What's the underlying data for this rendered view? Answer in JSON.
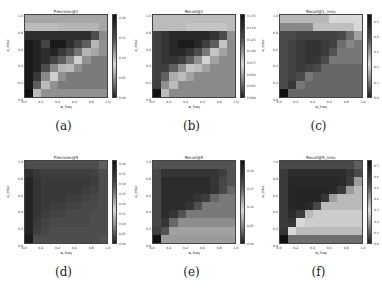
{
  "figure": {
    "panels": [
      {
        "caption": "(a)",
        "title": "Precision@1",
        "xlabel": "w_freq",
        "ylabel": "w_misc",
        "cbar_ticks": [
          "0.00",
          "0.05",
          "0.10",
          "0.15",
          "0.20"
        ],
        "cbar_max": 0.21
      },
      {
        "caption": "(b)",
        "title": "Recall@1",
        "xlabel": "w_freq",
        "ylabel": "w_misc",
        "cbar_ticks": [
          "0.000",
          "0.025",
          "0.050",
          "0.075",
          "0.100",
          "0.125",
          "0.150",
          "0.175"
        ],
        "cbar_max": 0.18
      },
      {
        "caption": "(c)",
        "title": "Recall@1_misc",
        "xlabel": "w_freq",
        "ylabel": "w_misc",
        "cbar_ticks": [
          "0.0",
          "0.1",
          "0.2",
          "0.3",
          "0.4",
          "0.5"
        ],
        "cbar_max": 0.55
      },
      {
        "caption": "(d)",
        "title": "Precision@5",
        "xlabel": "w_freq",
        "ylabel": "w_misc",
        "cbar_ticks": [
          "0.00",
          "0.05",
          "0.10",
          "0.15",
          "0.20",
          "0.25",
          "0.30",
          "0.35",
          "0.40"
        ],
        "cbar_max": 0.42
      },
      {
        "caption": "(e)",
        "title": "Recall@5",
        "xlabel": "w_freq",
        "ylabel": "w_misc",
        "cbar_ticks": [
          "0.00",
          "0.05",
          "0.10",
          "0.15",
          "0.20"
        ],
        "cbar_max": 0.23
      },
      {
        "caption": "(f)",
        "title": "Recall@5_misc",
        "xlabel": "w_freq",
        "ylabel": "w_misc",
        "cbar_ticks": [
          "0.0",
          "0.1",
          "0.2",
          "0.3",
          "0.4",
          "0.5",
          "0.6",
          "0.7"
        ],
        "cbar_max": 0.75
      }
    ],
    "xticks": [
      "0.0",
      "0.2",
      "0.4",
      "0.6",
      "0.8",
      "1.0"
    ],
    "yticks": [
      "0.0",
      "0.2",
      "0.4",
      "0.6",
      "0.8",
      "1.0"
    ]
  },
  "chart_data": [
    {
      "type": "heatmap",
      "title": "Precision@1",
      "xlabel": "w_freq",
      "ylabel": "w_misc",
      "x": [
        0.0,
        0.1,
        0.2,
        0.3,
        0.4,
        0.5,
        0.6,
        0.7,
        0.8,
        0.9
      ],
      "y": [
        0.9,
        0.8,
        0.7,
        0.6,
        0.5,
        0.4,
        0.3,
        0.2,
        0.1,
        0.0
      ],
      "zlim": [
        0,
        0.21
      ],
      "z": [
        [
          0.06,
          0.06,
          0.06,
          0.06,
          0.06,
          0.06,
          0.06,
          0.06,
          0.06,
          0.06
        ],
        [
          0.07,
          0.07,
          0.07,
          0.07,
          0.1,
          0.1,
          0.1,
          0.1,
          0.1,
          0.06
        ],
        [
          0.18,
          0.18,
          0.18,
          0.18,
          0.18,
          0.18,
          0.18,
          0.18,
          0.15,
          0.12
        ],
        [
          0.2,
          0.19,
          0.16,
          0.2,
          0.2,
          0.18,
          0.16,
          0.14,
          0.1,
          0.05
        ],
        [
          0.2,
          0.19,
          0.18,
          0.19,
          0.17,
          0.15,
          0.13,
          0.1,
          0.06,
          0.05
        ],
        [
          0.2,
          0.19,
          0.18,
          0.16,
          0.14,
          0.12,
          0.08,
          0.05,
          0.04,
          0.04
        ],
        [
          0.2,
          0.19,
          0.15,
          0.12,
          0.1,
          0.07,
          0.05,
          0.04,
          0.04,
          0.04
        ],
        [
          0.2,
          0.17,
          0.12,
          0.08,
          0.05,
          0.04,
          0.04,
          0.04,
          0.04,
          0.04
        ],
        [
          0.2,
          0.14,
          0.07,
          0.05,
          0.04,
          0.04,
          0.04,
          0.04,
          0.04,
          0.04
        ],
        [
          0.21,
          0.07,
          0.05,
          0.05,
          0.05,
          0.05,
          0.05,
          0.05,
          0.05,
          0.05
        ]
      ]
    },
    {
      "type": "heatmap",
      "title": "Recall@1",
      "xlabel": "w_freq",
      "ylabel": "w_misc",
      "x": [
        0.0,
        0.1,
        0.2,
        0.3,
        0.4,
        0.5,
        0.6,
        0.7,
        0.8,
        0.9
      ],
      "y": [
        0.9,
        0.8,
        0.7,
        0.6,
        0.5,
        0.4,
        0.3,
        0.2,
        0.1,
        0.0
      ],
      "zlim": [
        0,
        0.18
      ],
      "z": [
        [
          0.06,
          0.06,
          0.06,
          0.06,
          0.06,
          0.06,
          0.06,
          0.06,
          0.06,
          0.06
        ],
        [
          0.06,
          0.06,
          0.06,
          0.06,
          0.08,
          0.08,
          0.08,
          0.08,
          0.08,
          0.06
        ],
        [
          0.14,
          0.15,
          0.16,
          0.16,
          0.16,
          0.16,
          0.16,
          0.15,
          0.13,
          0.1
        ],
        [
          0.14,
          0.15,
          0.16,
          0.17,
          0.17,
          0.16,
          0.14,
          0.12,
          0.08,
          0.04
        ],
        [
          0.14,
          0.15,
          0.16,
          0.16,
          0.15,
          0.13,
          0.11,
          0.08,
          0.05,
          0.04
        ],
        [
          0.14,
          0.15,
          0.15,
          0.14,
          0.12,
          0.1,
          0.07,
          0.05,
          0.04,
          0.04
        ],
        [
          0.14,
          0.14,
          0.12,
          0.1,
          0.08,
          0.06,
          0.05,
          0.04,
          0.04,
          0.04
        ],
        [
          0.14,
          0.12,
          0.09,
          0.06,
          0.05,
          0.04,
          0.04,
          0.04,
          0.04,
          0.04
        ],
        [
          0.14,
          0.1,
          0.06,
          0.04,
          0.04,
          0.04,
          0.04,
          0.04,
          0.04,
          0.04
        ],
        [
          0.18,
          0.06,
          0.04,
          0.04,
          0.04,
          0.04,
          0.04,
          0.04,
          0.04,
          0.04
        ]
      ]
    },
    {
      "type": "heatmap",
      "title": "Recall@1_misc",
      "xlabel": "w_freq",
      "ylabel": "w_misc",
      "x": [
        0.0,
        0.1,
        0.2,
        0.3,
        0.4,
        0.5,
        0.6,
        0.7,
        0.8,
        0.9
      ],
      "y": [
        0.9,
        0.8,
        0.7,
        0.6,
        0.5,
        0.4,
        0.3,
        0.2,
        0.1,
        0.0
      ],
      "zlim": [
        0,
        0.55
      ],
      "z": [
        [
          0.18,
          0.18,
          0.18,
          0.18,
          0.18,
          0.18,
          0.22,
          0.22,
          0.22,
          0.22
        ],
        [
          0.12,
          0.12,
          0.12,
          0.12,
          0.25,
          0.25,
          0.25,
          0.25,
          0.25,
          0.22
        ],
        [
          0.4,
          0.4,
          0.42,
          0.42,
          0.42,
          0.42,
          0.42,
          0.4,
          0.35,
          0.15
        ],
        [
          0.4,
          0.42,
          0.44,
          0.46,
          0.46,
          0.44,
          0.42,
          0.35,
          0.12,
          0.1
        ],
        [
          0.4,
          0.42,
          0.44,
          0.46,
          0.46,
          0.44,
          0.38,
          0.1,
          0.1,
          0.1
        ],
        [
          0.4,
          0.42,
          0.44,
          0.46,
          0.45,
          0.4,
          0.1,
          0.1,
          0.1,
          0.1
        ],
        [
          0.4,
          0.42,
          0.44,
          0.42,
          0.4,
          0.08,
          0.08,
          0.08,
          0.08,
          0.08
        ],
        [
          0.4,
          0.42,
          0.4,
          0.1,
          0.08,
          0.08,
          0.08,
          0.08,
          0.08,
          0.08
        ],
        [
          0.4,
          0.45,
          0.1,
          0.08,
          0.08,
          0.08,
          0.08,
          0.08,
          0.08,
          0.08
        ],
        [
          0.55,
          0.08,
          0.08,
          0.08,
          0.08,
          0.08,
          0.08,
          0.08,
          0.08,
          0.08
        ]
      ]
    },
    {
      "type": "heatmap",
      "title": "Precision@5",
      "xlabel": "w_freq",
      "ylabel": "w_misc",
      "x": [
        0.0,
        0.1,
        0.2,
        0.3,
        0.4,
        0.5,
        0.6,
        0.7,
        0.8,
        0.9
      ],
      "y": [
        0.9,
        0.8,
        0.7,
        0.6,
        0.5,
        0.4,
        0.3,
        0.2,
        0.1,
        0.0
      ],
      "zlim": [
        0,
        0.42
      ],
      "z": [
        [
          0.3,
          0.3,
          0.3,
          0.3,
          0.3,
          0.3,
          0.3,
          0.3,
          0.3,
          0.28
        ],
        [
          0.36,
          0.34,
          0.33,
          0.33,
          0.33,
          0.33,
          0.33,
          0.33,
          0.32,
          0.3
        ],
        [
          0.38,
          0.35,
          0.34,
          0.34,
          0.34,
          0.34,
          0.34,
          0.34,
          0.33,
          0.3
        ],
        [
          0.38,
          0.35,
          0.34,
          0.34,
          0.34,
          0.34,
          0.34,
          0.33,
          0.32,
          0.3
        ],
        [
          0.38,
          0.35,
          0.34,
          0.34,
          0.34,
          0.33,
          0.33,
          0.32,
          0.31,
          0.3
        ],
        [
          0.38,
          0.35,
          0.34,
          0.33,
          0.33,
          0.32,
          0.32,
          0.31,
          0.31,
          0.3
        ],
        [
          0.38,
          0.35,
          0.33,
          0.32,
          0.32,
          0.31,
          0.31,
          0.31,
          0.3,
          0.3
        ],
        [
          0.38,
          0.34,
          0.32,
          0.31,
          0.31,
          0.31,
          0.31,
          0.31,
          0.3,
          0.3
        ],
        [
          0.38,
          0.33,
          0.31,
          0.3,
          0.3,
          0.3,
          0.3,
          0.3,
          0.3,
          0.3
        ],
        [
          0.4,
          0.3,
          0.3,
          0.3,
          0.3,
          0.3,
          0.3,
          0.3,
          0.3,
          0.29
        ]
      ]
    },
    {
      "type": "heatmap",
      "title": "Recall@5",
      "xlabel": "w_freq",
      "ylabel": "w_misc",
      "x": [
        0.0,
        0.1,
        0.2,
        0.3,
        0.4,
        0.5,
        0.6,
        0.7,
        0.8,
        0.9
      ],
      "y": [
        0.9,
        0.8,
        0.7,
        0.6,
        0.5,
        0.4,
        0.3,
        0.2,
        0.1,
        0.0
      ],
      "zlim": [
        0,
        0.23
      ],
      "z": [
        [
          0.16,
          0.16,
          0.16,
          0.16,
          0.16,
          0.16,
          0.16,
          0.16,
          0.16,
          0.16
        ],
        [
          0.17,
          0.19,
          0.19,
          0.19,
          0.19,
          0.19,
          0.19,
          0.19,
          0.18,
          0.16
        ],
        [
          0.17,
          0.2,
          0.2,
          0.2,
          0.2,
          0.2,
          0.2,
          0.19,
          0.17,
          0.16
        ],
        [
          0.17,
          0.2,
          0.2,
          0.2,
          0.2,
          0.2,
          0.2,
          0.19,
          0.17,
          0.15
        ],
        [
          0.17,
          0.2,
          0.2,
          0.2,
          0.2,
          0.19,
          0.18,
          0.15,
          0.14,
          0.14
        ],
        [
          0.17,
          0.2,
          0.2,
          0.2,
          0.19,
          0.16,
          0.14,
          0.14,
          0.14,
          0.14
        ],
        [
          0.17,
          0.2,
          0.19,
          0.16,
          0.14,
          0.14,
          0.14,
          0.14,
          0.14,
          0.14
        ],
        [
          0.17,
          0.19,
          0.15,
          0.13,
          0.13,
          0.13,
          0.13,
          0.13,
          0.13,
          0.13
        ],
        [
          0.18,
          0.16,
          0.12,
          0.12,
          0.12,
          0.12,
          0.12,
          0.12,
          0.12,
          0.12
        ],
        [
          0.23,
          0.06,
          0.06,
          0.06,
          0.06,
          0.06,
          0.06,
          0.06,
          0.06,
          0.06
        ]
      ]
    },
    {
      "type": "heatmap",
      "title": "Recall@5_misc",
      "xlabel": "w_freq",
      "ylabel": "w_misc",
      "x": [
        0.0,
        0.1,
        0.2,
        0.3,
        0.4,
        0.5,
        0.6,
        0.7,
        0.8,
        0.9
      ],
      "y": [
        0.9,
        0.8,
        0.7,
        0.6,
        0.5,
        0.4,
        0.3,
        0.2,
        0.1,
        0.0
      ],
      "zlim": [
        0,
        0.75
      ],
      "z": [
        [
          0.55,
          0.55,
          0.55,
          0.55,
          0.55,
          0.55,
          0.55,
          0.55,
          0.55,
          0.5
        ],
        [
          0.6,
          0.65,
          0.65,
          0.65,
          0.65,
          0.65,
          0.65,
          0.65,
          0.62,
          0.55
        ],
        [
          0.6,
          0.67,
          0.67,
          0.67,
          0.67,
          0.67,
          0.67,
          0.66,
          0.6,
          0.4
        ],
        [
          0.6,
          0.67,
          0.68,
          0.68,
          0.68,
          0.68,
          0.66,
          0.6,
          0.4,
          0.35
        ],
        [
          0.6,
          0.67,
          0.68,
          0.68,
          0.68,
          0.62,
          0.4,
          0.35,
          0.35,
          0.35
        ],
        [
          0.6,
          0.67,
          0.68,
          0.66,
          0.55,
          0.35,
          0.35,
          0.35,
          0.35,
          0.35
        ],
        [
          0.6,
          0.66,
          0.6,
          0.35,
          0.32,
          0.32,
          0.32,
          0.32,
          0.32,
          0.32
        ],
        [
          0.6,
          0.62,
          0.3,
          0.28,
          0.28,
          0.28,
          0.28,
          0.28,
          0.28,
          0.28
        ],
        [
          0.62,
          0.3,
          0.25,
          0.25,
          0.25,
          0.25,
          0.25,
          0.25,
          0.25,
          0.25
        ],
        [
          0.75,
          0.12,
          0.12,
          0.12,
          0.12,
          0.12,
          0.12,
          0.12,
          0.12,
          0.12
        ]
      ]
    }
  ]
}
